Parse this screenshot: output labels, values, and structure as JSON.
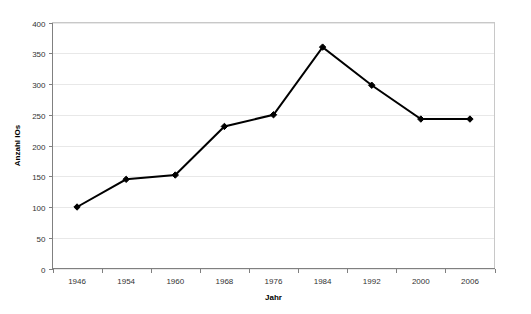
{
  "chart_data": {
    "type": "line",
    "title": "",
    "xlabel": "Jahr",
    "ylabel": "Anzahl IOs",
    "categories": [
      "1946",
      "1954",
      "1960",
      "1968",
      "1976",
      "1984",
      "1992",
      "2000",
      "2006"
    ],
    "values": [
      100,
      145,
      152,
      231,
      250,
      360,
      298,
      243,
      243
    ],
    "series": [
      {
        "name": "Anzahl IOs",
        "values": [
          100,
          145,
          152,
          231,
          250,
          360,
          298,
          243,
          243
        ]
      }
    ],
    "ylim": [
      0,
      400
    ],
    "y_ticks": [
      "0",
      "50",
      "100",
      "150",
      "200",
      "250",
      "300",
      "350",
      "400"
    ],
    "y_tick_values": [
      0,
      50,
      100,
      150,
      200,
      250,
      300,
      350,
      400
    ],
    "grid": true,
    "grid_axis": "y",
    "legend": false,
    "legend_position": "none",
    "marker": "diamond",
    "line_color": "#000000",
    "grid_color": "#e8e8e8",
    "plot_border_color": "#c8c8c8",
    "axis_color": "#808080",
    "background_color": "#ffffff"
  }
}
